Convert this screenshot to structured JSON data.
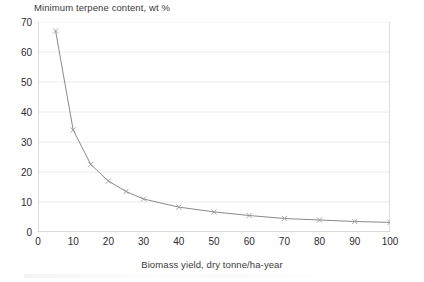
{
  "chart_data": {
    "type": "line",
    "title": "Minimum terpene content, wt %",
    "xlabel": "Biomass yield, dry tonne/ha-year",
    "ylabel": "",
    "xlim": [
      0,
      100
    ],
    "ylim": [
      0,
      70
    ],
    "xticks": [
      0,
      10,
      20,
      30,
      40,
      50,
      60,
      70,
      80,
      90,
      100
    ],
    "yticks": [
      0,
      10,
      20,
      30,
      40,
      50,
      60,
      70
    ],
    "xtick_labels": [
      "0",
      "10",
      "20",
      "30",
      "40",
      "50",
      "60",
      "70",
      "80",
      "90",
      "100"
    ],
    "ytick_labels": [
      "0",
      "10",
      "20",
      "30",
      "40",
      "50",
      "60",
      "70"
    ],
    "grid": "horizontal",
    "legend": "none",
    "marker": "x",
    "line_color": "#8a8a8a",
    "marker_color": "#9a9a9a",
    "grid_color": "#ececee",
    "axis_color": "#b9b9bd",
    "x": [
      5,
      10,
      15,
      20,
      25,
      30,
      40,
      50,
      60,
      70,
      80,
      90,
      100
    ],
    "values": [
      67,
      34,
      22.5,
      17,
      13.5,
      11,
      8.3,
      6.7,
      5.5,
      4.5,
      4,
      3.5,
      3.2
    ],
    "series": [
      {
        "name": "Minimum terpene content",
        "values": [
          67,
          34,
          22.5,
          17,
          13.5,
          11,
          8.3,
          6.7,
          5.5,
          4.5,
          4,
          3.5,
          3.2
        ]
      }
    ]
  }
}
